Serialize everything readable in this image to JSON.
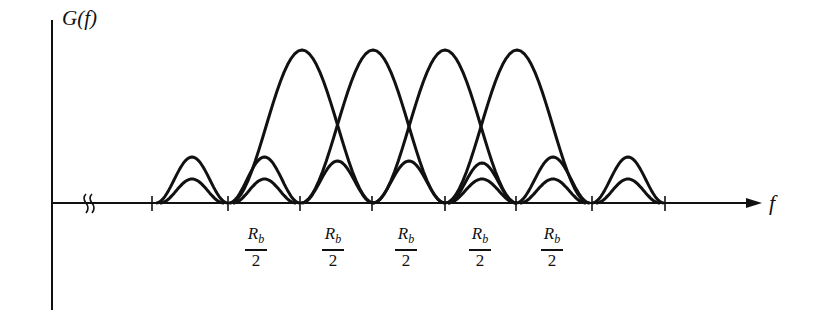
{
  "figure": {
    "y_axis_label": "G(f)",
    "x_axis_label": "f",
    "axis_break_symbol": "≈",
    "tick_labels": [
      {
        "num": "R",
        "sub": "b",
        "den": "2"
      },
      {
        "num": "R",
        "sub": "b",
        "den": "2"
      },
      {
        "num": "R",
        "sub": "b",
        "den": "2"
      },
      {
        "num": "R",
        "sub": "b",
        "den": "2"
      },
      {
        "num": "R",
        "sub": "b",
        "den": "2"
      }
    ],
    "tick_x": [
      152,
      228,
      300,
      372,
      445,
      516,
      592,
      665
    ],
    "main_lobe_centers_x": [
      302,
      373,
      445,
      517
    ],
    "colors": {
      "stroke": "#111111",
      "background": "#ffffff"
    }
  }
}
